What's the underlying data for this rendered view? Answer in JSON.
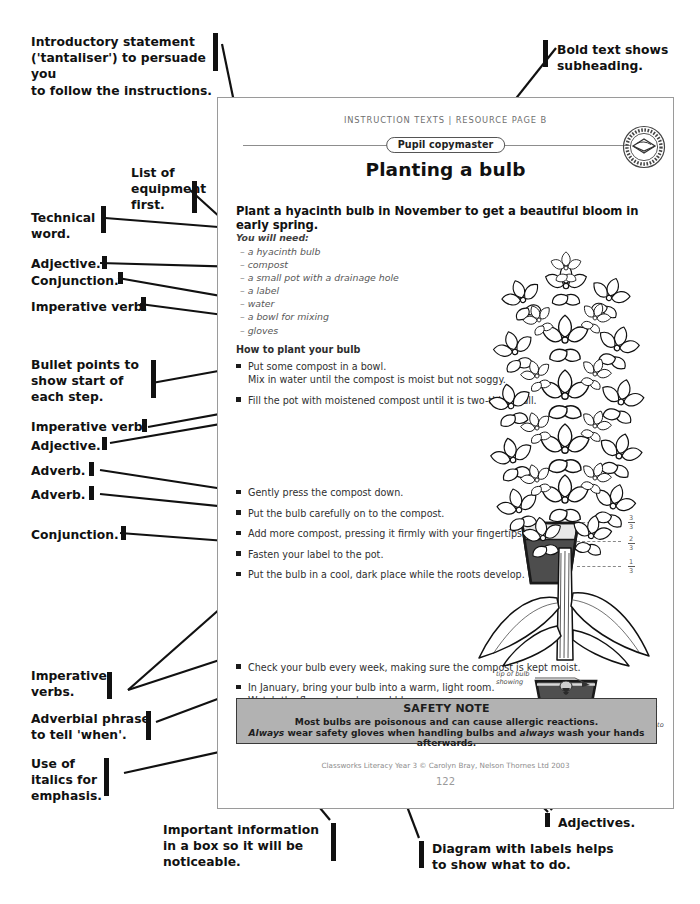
{
  "annotations_left": [
    {
      "id": "intro",
      "text": "Introductory statement\n('tantaliser') to persuade you\nto follow the instructions."
    },
    {
      "id": "list-equipment",
      "text": "List of\nequipment\nfirst."
    },
    {
      "id": "technical-word",
      "text": "Technical\nword."
    },
    {
      "id": "adjective-1",
      "text": "Adjective."
    },
    {
      "id": "conjunction-1",
      "text": "Conjunction."
    },
    {
      "id": "imperative-verb-1",
      "text": "Imperative verb."
    },
    {
      "id": "bullet-points",
      "text": "Bullet points to\nshow start of\neach step."
    },
    {
      "id": "imperative-verb-2",
      "text": "Imperative verb."
    },
    {
      "id": "adjective-2",
      "text": "Adjective."
    },
    {
      "id": "adverb-1",
      "text": "Adverb."
    },
    {
      "id": "adverb-2",
      "text": "Adverb."
    },
    {
      "id": "conjunction-2",
      "text": "Conjunction."
    },
    {
      "id": "imperative-verbs",
      "text": "Imperative\nverbs."
    },
    {
      "id": "adverbial-phrase",
      "text": "Adverbial phrase\nto tell 'when'."
    },
    {
      "id": "italics",
      "text": "Use of\nitalics for\nemphasis."
    }
  ],
  "annotations_top": [
    {
      "id": "bold-text",
      "text": "Bold text shows\nsubheading."
    }
  ],
  "annotations_bottom": [
    {
      "id": "important-box",
      "text": "Important information\nin a box so it will be\nnoticeable."
    },
    {
      "id": "adjectives",
      "text": "Adjectives."
    },
    {
      "id": "diagram-labels",
      "text": "Diagram with labels helps\nto show what to do."
    }
  ],
  "page": {
    "header": "Instruction Texts  |  Resource Page B",
    "copymaster_badge": "Pupil copymaster",
    "stamp_text": "PHOTOCOPIABLE",
    "title": "Planting a bulb",
    "tantaliser": "Plant a hyacinth bulb in November to get a beautiful bloom in early spring.",
    "equipment_heading": "You will need:",
    "equipment": [
      "a hyacinth bulb",
      "compost",
      "a small pot with a drainage hole",
      "a label",
      "water",
      "a bowl for mixing",
      "gloves"
    ],
    "method_heading": "How to plant your bulb",
    "steps": [
      {
        "text": "Put some compost in a bowl.",
        "cont": "Mix in water until the compost is moist but not soggy."
      },
      {
        "text": "Fill the pot with moistened compost until it is two-thirds full.",
        "cont": ""
      },
      {
        "text": "Gently press the compost down.",
        "cont": ""
      },
      {
        "text": "Put the bulb carefully on to the compost.",
        "cont": ""
      },
      {
        "text": "Add more compost, pressing it firmly with your fingertips.",
        "cont": ""
      },
      {
        "text": "Fasten your label to the pot.",
        "cont": ""
      },
      {
        "text": "Put the bulb in a cool, dark place while the roots develop.",
        "cont": ""
      },
      {
        "text": "Check your bulb every week, making sure the compost is kept moist.",
        "cont": ""
      },
      {
        "text": "In January, bring your bulb into a warm, light room.",
        "cont": "Watch the flower develop and bloom."
      }
    ],
    "diagram1": {
      "fractions": [
        {
          "num": "3",
          "den": "3"
        },
        {
          "num": "2",
          "den": "3"
        },
        {
          "num": "1",
          "den": "3"
        }
      ]
    },
    "diagram2": {
      "label_tip": "tip of bulb\nshowing",
      "label_space": "plenty of space\nfor roots to develop"
    },
    "safety": {
      "heading": "SAFETY NOTE",
      "line1": "Most bulbs are poisonous and can cause allergic reactions.",
      "line2_a": "Always",
      "line2_b": " wear safety gloves when handling bulbs and ",
      "line2_c": "always",
      "line2_d": " wash your hands afterwards."
    },
    "credit": "Classworks Literacy Year 3 © Carolyn Bray, Nelson Thornes Ltd 2003",
    "page_number": "122"
  },
  "colors": {
    "ink": "#111111",
    "page_border": "#9a9a9a",
    "safety_fill": "#b2b2b2",
    "compost": "#4d4d4d",
    "water": "#e6e6e6",
    "muted_text": "#585858"
  }
}
